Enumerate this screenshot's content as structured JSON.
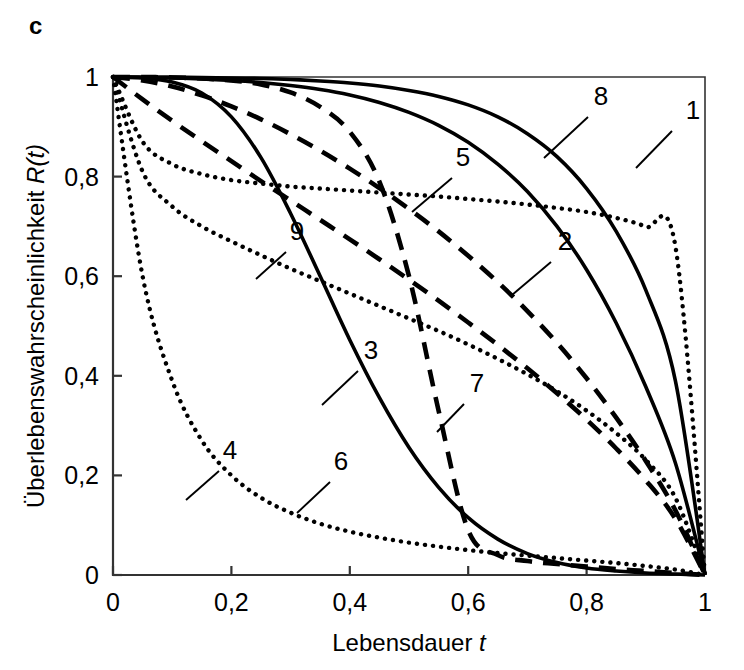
{
  "panel": {
    "letter": "c"
  },
  "axes": {
    "x": {
      "title_main": "Lebensdauer",
      "title_var": "t",
      "ticks": [
        "0",
        "0,2",
        "0,4",
        "0,6",
        "0,8",
        "1"
      ],
      "tick_values": [
        0,
        0.2,
        0.4,
        0.6,
        0.8,
        1.0
      ],
      "range": [
        0,
        1
      ]
    },
    "y": {
      "title_main": "Überlebenswahrscheinlichkeit",
      "title_var": "R(t)",
      "ticks": [
        "0",
        "0,2",
        "0,4",
        "0,6",
        "0,8",
        "1"
      ],
      "tick_values": [
        0,
        0.2,
        0.4,
        0.6,
        0.8,
        1.0
      ],
      "range": [
        0,
        1
      ]
    }
  },
  "colors": {
    "ink": "#000000",
    "background": "#ffffff"
  },
  "curve_labels": [
    {
      "id": "1",
      "text": "1",
      "x": 693,
      "y": 119,
      "leader": [
        672,
        131,
        636,
        168
      ]
    },
    {
      "id": "2",
      "text": "2",
      "x": 565,
      "y": 250,
      "leader": [
        551,
        262,
        512,
        295
      ]
    },
    {
      "id": "3",
      "text": "3",
      "x": 371,
      "y": 359,
      "leader": [
        358,
        371,
        322,
        405
      ]
    },
    {
      "id": "4",
      "text": "4",
      "x": 230,
      "y": 459,
      "leader": [
        219,
        471,
        186,
        500
      ]
    },
    {
      "id": "5",
      "text": "5",
      "x": 463,
      "y": 166,
      "leader": [
        452,
        178,
        412,
        212
      ]
    },
    {
      "id": "6",
      "text": "6",
      "x": 341,
      "y": 470,
      "leader": [
        330,
        482,
        297,
        513
      ]
    },
    {
      "id": "7",
      "text": "7",
      "x": 477,
      "y": 392,
      "leader": [
        464,
        404,
        437,
        432
      ]
    },
    {
      "id": "8",
      "text": "8",
      "x": 601,
      "y": 105,
      "leader": [
        588,
        117,
        544,
        158
      ]
    },
    {
      "id": "9",
      "text": "9",
      "x": 297,
      "y": 240,
      "leader": [
        286,
        252,
        256,
        279
      ]
    }
  ],
  "chart_data": {
    "type": "line",
    "title": "",
    "xlabel": "Lebensdauer t",
    "ylabel": "Überlebenswahrscheinlichkeit R(t)",
    "xlim": [
      0,
      1
    ],
    "ylim": [
      0,
      1
    ],
    "grid": false,
    "legend": "inline-labels",
    "x": [
      0,
      0.05,
      0.1,
      0.15,
      0.2,
      0.25,
      0.3,
      0.35,
      0.4,
      0.45,
      0.5,
      0.55,
      0.6,
      0.65,
      0.7,
      0.75,
      0.8,
      0.85,
      0.9,
      0.95,
      1.0
    ],
    "series": [
      {
        "name": "1",
        "style": "solid",
        "values": [
          1.0,
          1.0,
          1.0,
          0.999,
          0.998,
          0.997,
          0.995,
          0.992,
          0.988,
          0.982,
          0.973,
          0.961,
          0.944,
          0.92,
          0.886,
          0.84,
          0.776,
          0.69,
          0.572,
          0.39,
          0.0
        ]
      },
      {
        "name": "2",
        "style": "dashed",
        "values": [
          1.0,
          0.993,
          0.981,
          0.963,
          0.941,
          0.915,
          0.885,
          0.852,
          0.816,
          0.777,
          0.735,
          0.69,
          0.641,
          0.588,
          0.53,
          0.466,
          0.395,
          0.316,
          0.229,
          0.13,
          0.0
        ]
      },
      {
        "name": "3",
        "style": "dashed",
        "values": [
          1.0,
          0.955,
          0.912,
          0.871,
          0.831,
          0.791,
          0.752,
          0.713,
          0.674,
          0.634,
          0.593,
          0.551,
          0.507,
          0.462,
          0.415,
          0.365,
          0.312,
          0.254,
          0.19,
          0.113,
          0.0
        ]
      },
      {
        "name": "4",
        "style": "dotted",
        "values": [
          1.0,
          0.6,
          0.39,
          0.27,
          0.2,
          0.155,
          0.125,
          0.103,
          0.087,
          0.075,
          0.065,
          0.057,
          0.05,
          0.044,
          0.039,
          0.034,
          0.029,
          0.024,
          0.018,
          0.011,
          0.0
        ]
      },
      {
        "name": "5",
        "style": "dotted",
        "values": [
          1.0,
          0.87,
          0.825,
          0.805,
          0.793,
          0.786,
          0.78,
          0.776,
          0.772,
          0.768,
          0.764,
          0.76,
          0.755,
          0.75,
          0.744,
          0.737,
          0.729,
          0.717,
          0.699,
          0.66,
          0.0
        ]
      },
      {
        "name": "6",
        "style": "solid",
        "values": [
          1.0,
          0.998,
          0.99,
          0.968,
          0.92,
          0.838,
          0.726,
          0.6,
          0.472,
          0.356,
          0.256,
          0.176,
          0.115,
          0.072,
          0.043,
          0.025,
          0.014,
          0.008,
          0.004,
          0.002,
          0.0
        ]
      },
      {
        "name": "7",
        "style": "dashed",
        "values": [
          1.0,
          1.0,
          0.999,
          0.997,
          0.993,
          0.985,
          0.969,
          0.94,
          0.89,
          0.79,
          0.6,
          0.33,
          0.09,
          0.04,
          0.028,
          0.022,
          0.017,
          0.012,
          0.008,
          0.004,
          0.0
        ]
      },
      {
        "name": "8",
        "style": "solid",
        "values": [
          1.0,
          0.999,
          0.998,
          0.996,
          0.993,
          0.989,
          0.983,
          0.975,
          0.964,
          0.949,
          0.929,
          0.903,
          0.869,
          0.825,
          0.77,
          0.7,
          0.613,
          0.506,
          0.378,
          0.225,
          0.0
        ]
      },
      {
        "name": "9",
        "style": "dotted",
        "values": [
          1.0,
          0.81,
          0.74,
          0.7,
          0.67,
          0.642,
          0.615,
          0.59,
          0.565,
          0.54,
          0.515,
          0.49,
          0.463,
          0.434,
          0.403,
          0.369,
          0.33,
          0.285,
          0.231,
          0.155,
          0.0
        ]
      }
    ]
  }
}
